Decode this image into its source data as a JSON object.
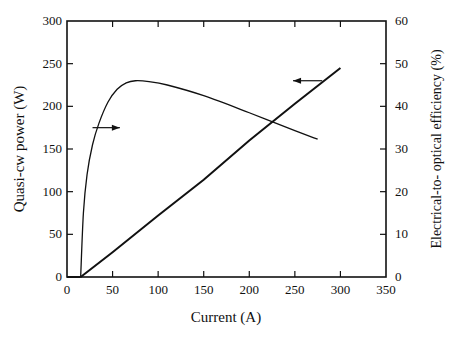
{
  "chart_data": {
    "type": "line",
    "title": "",
    "xlabel": "Current (A)",
    "ylabel": "Quasi-cw power (W)",
    "y2label": "Electrical-to- optical  efficiency (%)",
    "xlim": [
      0,
      350
    ],
    "ylim": [
      0,
      300
    ],
    "y2lim": [
      0,
      60
    ],
    "x_ticks": [
      0,
      50,
      100,
      150,
      200,
      250,
      300,
      350
    ],
    "y_ticks": [
      0,
      50,
      100,
      150,
      200,
      250,
      300
    ],
    "y2_ticks": [
      0,
      10,
      20,
      30,
      40,
      50,
      60
    ],
    "grid": false,
    "legend": null,
    "series": [
      {
        "name": "Quasi-cw power",
        "axis": "left",
        "unit": "W",
        "x": [
          15,
          50,
          100,
          150,
          200,
          250,
          300
        ],
        "y": [
          0,
          29,
          72,
          114,
          160,
          203,
          245
        ]
      },
      {
        "name": "Electrical-to-optical efficiency",
        "axis": "right",
        "unit": "%",
        "x": [
          15,
          18,
          22,
          28,
          35,
          45,
          55,
          65,
          75,
          90,
          110,
          150,
          200,
          250,
          275
        ],
        "y": [
          0,
          15,
          24,
          31,
          36,
          41,
          44,
          45.5,
          46,
          45.8,
          45,
          42.5,
          38.5,
          34.3,
          32.3
        ]
      }
    ],
    "annotations": [
      {
        "type": "arrow",
        "direction": "right",
        "from_x": 28,
        "to_x": 58,
        "y_left": 175,
        "meaning": "efficiency curve uses right axis"
      },
      {
        "type": "arrow",
        "direction": "left",
        "from_x": 280,
        "to_x": 248,
        "y_left": 230,
        "meaning": "power curve uses left axis"
      }
    ]
  },
  "labels": {
    "xlabel": "Current (A)",
    "ylabel": "Quasi-cw power (W)",
    "y2label": "Electrical-to- optical  efficiency (%)"
  }
}
